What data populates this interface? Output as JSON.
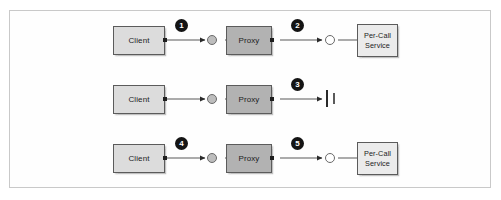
{
  "figure": {
    "frame": {
      "border_color": "#c9c9c9",
      "background": "#fefefe"
    }
  },
  "palette": {
    "client_fill": "#dcdcdc",
    "proxy_fill": "#b2b2b2",
    "service_fill": "#ebebeb",
    "node_border": "#5b5b5b",
    "connector": "#585858",
    "badge_fill": "#141414",
    "badge_text": "#ffffff",
    "port_filled": "#bdbdbd",
    "port_open": "#ffffff",
    "blocked_bar": "#2a2a2a"
  },
  "rows": [
    {
      "id": "row-1",
      "client": {
        "label": "Client"
      },
      "proxy": {
        "label": "Proxy"
      },
      "service": {
        "line1": "Per-Call",
        "line2": "Service"
      },
      "badges": [
        {
          "number": "1",
          "segment": "client-to-proxy"
        },
        {
          "number": "2",
          "segment": "proxy-to-service"
        }
      ],
      "proxy_port": "filled",
      "service_port": "open",
      "terminated": false
    },
    {
      "id": "row-2",
      "client": {
        "label": "Client"
      },
      "proxy": {
        "label": "Proxy"
      },
      "service": null,
      "badges": [
        {
          "number": "3",
          "segment": "proxy-to-blocked"
        }
      ],
      "proxy_port": "filled",
      "service_port": null,
      "terminated": true
    },
    {
      "id": "row-3",
      "client": {
        "label": "Client"
      },
      "proxy": {
        "label": "Proxy"
      },
      "service": {
        "line1": "Per-Call",
        "line2": "Service"
      },
      "badges": [
        {
          "number": "4",
          "segment": "client-to-proxy"
        },
        {
          "number": "5",
          "segment": "proxy-to-service"
        }
      ],
      "proxy_port": "filled",
      "service_port": "open",
      "terminated": false
    }
  ]
}
